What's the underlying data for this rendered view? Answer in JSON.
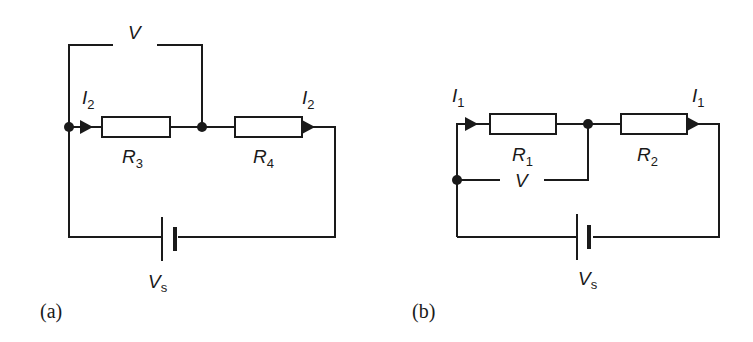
{
  "diagram": {
    "type": "circuit",
    "circuits": [
      {
        "id": "a",
        "caption": "(a)",
        "resistors": [
          {
            "label": "R",
            "subscript": "3"
          },
          {
            "label": "R",
            "subscript": "4"
          }
        ],
        "currents": [
          {
            "label": "I",
            "subscript": "2"
          },
          {
            "label": "I",
            "subscript": "2"
          }
        ],
        "voltmeter": {
          "label": "V",
          "across": "R3"
        },
        "source": {
          "label": "V",
          "subscript": "s"
        }
      },
      {
        "id": "b",
        "caption": "(b)",
        "resistors": [
          {
            "label": "R",
            "subscript": "1"
          },
          {
            "label": "R",
            "subscript": "2"
          }
        ],
        "currents": [
          {
            "label": "I",
            "subscript": "1"
          },
          {
            "label": "I",
            "subscript": "1"
          }
        ],
        "voltmeter": {
          "label": "V",
          "across": "R1"
        },
        "source": {
          "label": "V",
          "subscript": "s"
        }
      }
    ]
  }
}
